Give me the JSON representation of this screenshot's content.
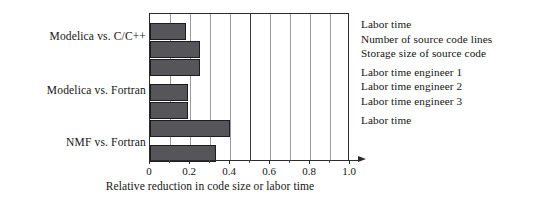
{
  "chart_data": {
    "type": "bar",
    "orientation": "horizontal",
    "title": "",
    "xlabel": "Relative reduction in code size or labor time",
    "ylabel": "",
    "xlim": [
      0,
      1.0
    ],
    "xticks": [
      0,
      0.2,
      0.4,
      0.6,
      0.8,
      1.0
    ],
    "xticklabels": [
      "0",
      "0.2",
      "0.4",
      "0.6",
      "0.8",
      "1.0"
    ],
    "minor_gridlines": [
      0.1,
      0.3,
      0.5,
      0.7,
      0.9
    ],
    "major_gridline_emphasis": 0.5,
    "grid": true,
    "legend_position": "right",
    "categories": [
      "Modelica vs. C/C++",
      "Modelica vs. Fortran",
      "NMF vs. Fortran"
    ],
    "groups": [
      {
        "category": "Modelica vs. C/C++",
        "bars": [
          {
            "label": "Labor time",
            "value": 0.18
          },
          {
            "label": "Number of source code lines",
            "value": 0.25
          },
          {
            "label": "Storage size of source code",
            "value": 0.25
          }
        ]
      },
      {
        "category": "Modelica vs. Fortran",
        "bars": [
          {
            "label": "Labor time engineer 1",
            "value": 0.19
          },
          {
            "label": "Labor time engineer 2",
            "value": 0.19
          },
          {
            "label": "Labor time engineer 3",
            "value": 0.4
          }
        ]
      },
      {
        "category": "NMF vs. Fortran",
        "bars": [
          {
            "label": "Labor time",
            "value": 0.33
          }
        ]
      }
    ],
    "bars_flat": [
      {
        "label": "Labor time",
        "value": 0.18
      },
      {
        "label": "Number of source code lines",
        "value": 0.25
      },
      {
        "label": "Storage size of source code",
        "value": 0.25
      },
      {
        "label": "Labor time engineer 1",
        "value": 0.19
      },
      {
        "label": "Labor time engineer 2",
        "value": 0.19
      },
      {
        "label": "Labor time engineer 3",
        "value": 0.4
      },
      {
        "label": "Labor time",
        "value": 0.33
      }
    ],
    "colors": {
      "bar_fill": "#55555a",
      "bar_edge": "#1c1c1c",
      "gridline": "#9a9aa6",
      "gridline_major": "#3a3a3a",
      "axis": "#2b2b2b",
      "text": "#141414",
      "background": "#ffffff"
    }
  },
  "legend": {
    "items": [
      "Labor time",
      "Number of source code lines",
      "Storage size of source code",
      "Labor time engineer 1",
      "Labor time engineer 2",
      "Labor time engineer 3",
      "Labor time"
    ]
  }
}
